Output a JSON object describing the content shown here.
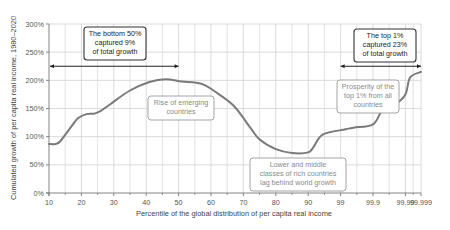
{
  "chart_data": {
    "type": "line",
    "title": "",
    "xlabel": "Percentile of the global distribution of per capita real income",
    "ylabel": "Cumulated growth of per capita real income, 1980–2020",
    "x_ticks": [
      "10",
      "20",
      "30",
      "40",
      "50",
      "60",
      "70",
      "80",
      "90",
      "99",
      "99.9",
      "99.99",
      "99.999"
    ],
    "y_ticks": [
      "0%",
      "50%",
      "100%",
      "150%",
      "200%",
      "250%",
      "300%"
    ],
    "ylim": [
      0,
      300
    ],
    "grid": true,
    "series": [
      {
        "name": "Cumulated growth",
        "color": "#7a7a7a",
        "points": [
          {
            "x": 10,
            "y": 87
          },
          {
            "x": 12,
            "y": 87
          },
          {
            "x": 13.5,
            "y": 92
          },
          {
            "x": 16.5,
            "y": 115
          },
          {
            "x": 19,
            "y": 133
          },
          {
            "x": 21.5,
            "y": 140
          },
          {
            "x": 24,
            "y": 141
          },
          {
            "x": 26,
            "y": 146
          },
          {
            "x": 29,
            "y": 158
          },
          {
            "x": 35,
            "y": 182
          },
          {
            "x": 41,
            "y": 197
          },
          {
            "x": 46,
            "y": 202
          },
          {
            "x": 51,
            "y": 198
          },
          {
            "x": 57,
            "y": 194
          },
          {
            "x": 61,
            "y": 181
          },
          {
            "x": 67,
            "y": 155
          },
          {
            "x": 72,
            "y": 117
          },
          {
            "x": 75,
            "y": 95
          },
          {
            "x": 80,
            "y": 78
          },
          {
            "x": 85,
            "y": 71
          },
          {
            "x": 90,
            "y": 72
          },
          {
            "x": 93,
            "y": 81
          },
          {
            "x": 96.5,
            "y": 104
          },
          {
            "x": 99.3,
            "y": 113
          },
          {
            "x": 99.6,
            "y": 116
          },
          {
            "x": 99.9,
            "y": 122
          },
          {
            "x": 99.95,
            "y": 148
          },
          {
            "x": 99.98,
            "y": 158
          },
          {
            "x": 99.99,
            "y": 175
          },
          {
            "x": 99.995,
            "y": 205
          },
          {
            "x": 99.999,
            "y": 215
          }
        ]
      }
    ],
    "annotations": [
      {
        "id": "bottom50",
        "lines": [
          "The bottom 50%",
          "captured 9%",
          "of total growth"
        ],
        "style": "dark"
      },
      {
        "id": "top1",
        "lines": [
          "The top 1%",
          "captured 23%",
          "of total growth"
        ],
        "style": "dark"
      },
      {
        "id": "emerging",
        "lines": [
          "Rise of emerging",
          "countries"
        ],
        "style": "light"
      },
      {
        "id": "lower-middle",
        "lines": [
          "Lower and middle",
          "classes of rich countries",
          "lag behind world growth"
        ],
        "style": "light"
      },
      {
        "id": "prosperity",
        "lines": [
          "Prosperity of the",
          "top 1% from all",
          "countries"
        ],
        "style": "light"
      }
    ],
    "ranges": [
      {
        "id": "bottom50-range",
        "from": "10",
        "to": "50",
        "y": 225
      },
      {
        "id": "top1-range",
        "from": "99",
        "to": "99.999",
        "y": 225
      }
    ]
  }
}
